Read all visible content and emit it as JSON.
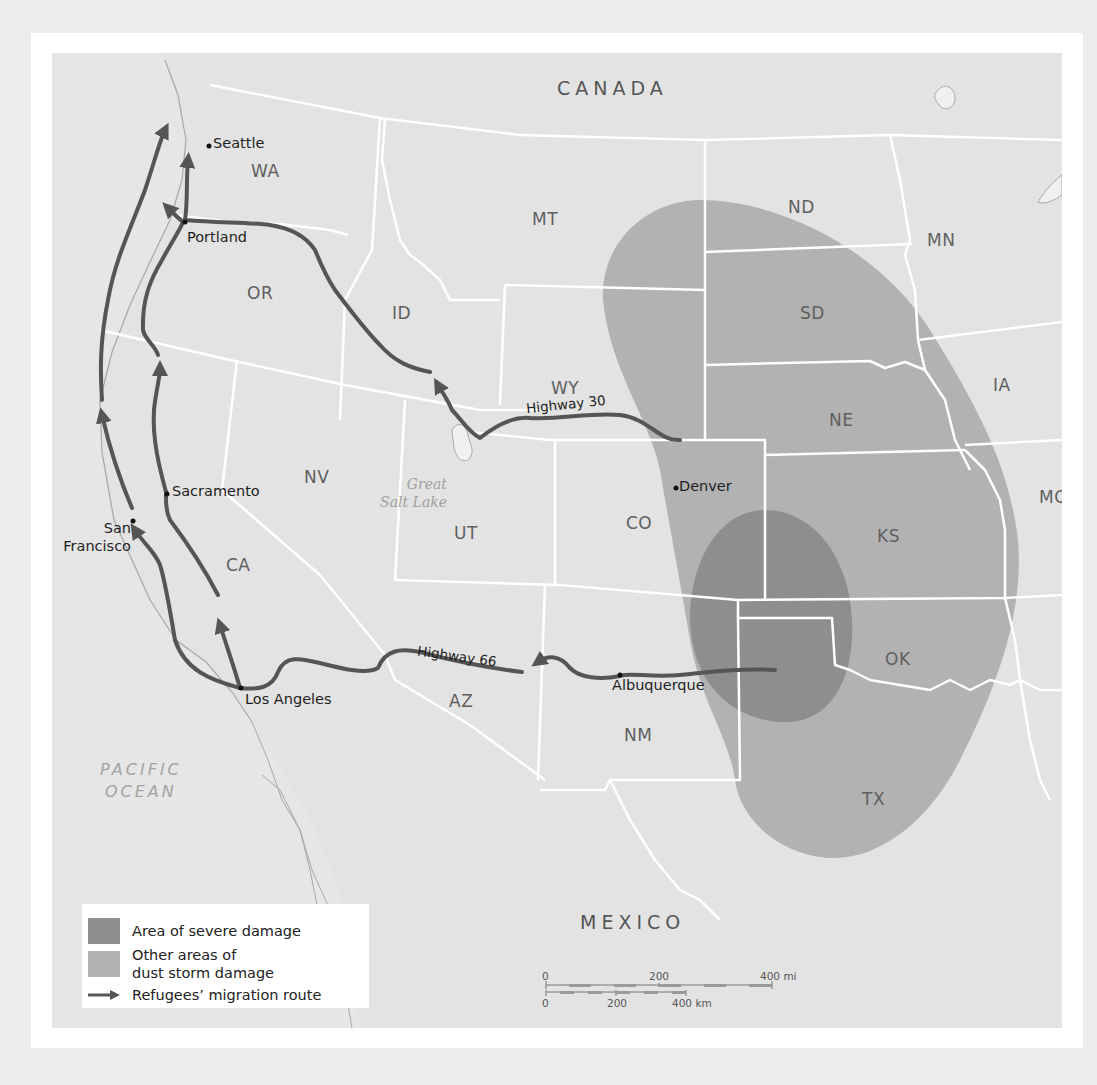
{
  "map": {
    "colors": {
      "background": "#e3e3e3",
      "severe_damage": "#8e8e8e",
      "other_damage": "#b2b2b2",
      "route": "#555555",
      "state_border": "#ffffff"
    },
    "countries": [
      {
        "id": "canada",
        "label": "CANADA"
      },
      {
        "id": "mexico",
        "label": "MEXICO"
      }
    ],
    "ocean": {
      "line1": "PACIFIC",
      "line2": "OCEAN"
    },
    "lake": {
      "line1": "Great",
      "line2": "Salt Lake"
    },
    "states": [
      {
        "id": "wa",
        "label": "WA"
      },
      {
        "id": "or",
        "label": "OR"
      },
      {
        "id": "id",
        "label": "ID"
      },
      {
        "id": "mt",
        "label": "MT"
      },
      {
        "id": "wy",
        "label": "WY"
      },
      {
        "id": "nd",
        "label": "ND"
      },
      {
        "id": "sd",
        "label": "SD"
      },
      {
        "id": "ne",
        "label": "NE"
      },
      {
        "id": "mn",
        "label": "MN"
      },
      {
        "id": "ia",
        "label": "IA"
      },
      {
        "id": "mo",
        "label": "MO"
      },
      {
        "id": "ks",
        "label": "KS"
      },
      {
        "id": "co",
        "label": "CO"
      },
      {
        "id": "ut",
        "label": "UT"
      },
      {
        "id": "nv",
        "label": "NV"
      },
      {
        "id": "ca",
        "label": "CA"
      },
      {
        "id": "az",
        "label": "AZ"
      },
      {
        "id": "nm",
        "label": "NM"
      },
      {
        "id": "ok",
        "label": "OK"
      },
      {
        "id": "tx",
        "label": "TX"
      }
    ],
    "cities": [
      {
        "id": "seattle",
        "label": "Seattle"
      },
      {
        "id": "portland",
        "label": "Portland"
      },
      {
        "id": "sacramento",
        "label": "Sacramento"
      },
      {
        "id": "san-francisco",
        "line1": "San",
        "line2": "Francisco"
      },
      {
        "id": "los-angeles",
        "label": "Los Angeles"
      },
      {
        "id": "denver",
        "label": "Denver"
      },
      {
        "id": "albuquerque",
        "label": "Albuquerque"
      }
    ],
    "highways": [
      {
        "id": "highway-30",
        "label": "Highway 30"
      },
      {
        "id": "highway-66",
        "label": "Highway 66"
      }
    ]
  },
  "legend": {
    "items": [
      {
        "id": "severe",
        "label": "Area of severe damage"
      },
      {
        "id": "other",
        "line1": "Other areas of",
        "line2": "dust storm damage"
      },
      {
        "id": "route",
        "label": "Refugees’ migration route"
      }
    ]
  },
  "scale": {
    "miles": {
      "ticks": [
        "0",
        "200",
        "400 mi"
      ]
    },
    "km": {
      "ticks": [
        "0",
        "200",
        "400 km"
      ]
    }
  }
}
